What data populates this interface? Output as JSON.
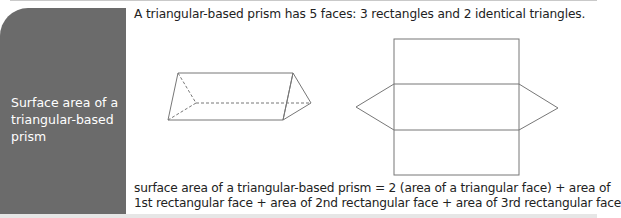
{
  "sidebar": {
    "title": "Surface area of a triangular-based prism",
    "color": "#6b6b6b"
  },
  "main": {
    "intro": "A triangular-based prism has 5 faces: 3 rectangles and 2 identical triangles.",
    "formula_line1": "surface area of a triangular-based prism = 2 (area of a triangular face) + area of",
    "formula_line2": "1st rectangular face + area of 2nd rectangular face + area of 3rd rectangular face"
  },
  "figures": {
    "prism": "triangular-prism-3d-drawing",
    "net": "triangular-prism-net"
  }
}
